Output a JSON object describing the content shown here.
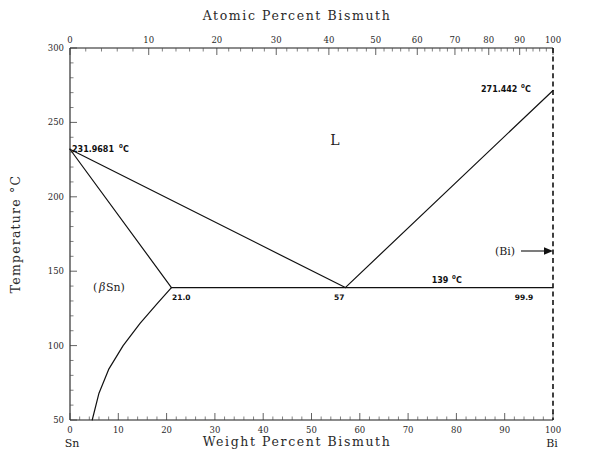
{
  "figure": {
    "title_top": "Atomic Percent Bismuth",
    "title_bottom": "Weight Percent Bismuth",
    "title_left": "Temperature °C",
    "left_endpoint": "Sn",
    "right_endpoint": "Bi"
  },
  "chart_data": {
    "type": "line",
    "xlabel": "Weight Percent Bismuth",
    "ylabel": "Temperature °C",
    "xlabel_secondary": "Atomic Percent Bismuth",
    "xlim": [
      0,
      100
    ],
    "ylim": [
      50,
      300
    ],
    "grid": false,
    "legend": "none",
    "x_ticks_bottom": [
      0,
      10,
      20,
      30,
      40,
      50,
      60,
      70,
      80,
      90,
      100
    ],
    "x_tick_labels_bottom": [
      "0",
      "10",
      "20",
      "30",
      "40",
      "50",
      "60",
      "70",
      "80",
      "90",
      "100"
    ],
    "y_ticks": [
      50,
      100,
      150,
      200,
      250,
      300
    ],
    "y_tick_labels": [
      "50",
      "100",
      "150",
      "200",
      "250",
      "300"
    ],
    "x_ticks_top_atomic": [
      0,
      10,
      20,
      30,
      40,
      50,
      60,
      70,
      80,
      90,
      100
    ],
    "x_tick_labels_top": [
      "0",
      "10",
      "20",
      "30",
      "40",
      "50",
      "60",
      "70",
      "80",
      "90",
      "100"
    ],
    "x_ticks_top_weight_positions": [
      0.0,
      16.3,
      30.4,
      42.7,
      53.6,
      63.3,
      71.9,
      79.7,
      86.7,
      93.1,
      100.0
    ],
    "series": [
      {
        "name": "Sn-rich liquidus",
        "comment": "liquidus from Sn melting point down to eutectic",
        "x": [
          0,
          57
        ],
        "y": [
          231.9681,
          139
        ]
      },
      {
        "name": "Bi-rich liquidus",
        "comment": "liquidus from eutectic up to Bi melting point",
        "x": [
          57,
          100
        ],
        "y": [
          139,
          271.442
        ]
      },
      {
        "name": "beta-Sn solidus",
        "comment": "solidus from Sn melting point to eutectic solubility limit",
        "x": [
          0,
          21.0
        ],
        "y": [
          231.9681,
          139
        ]
      },
      {
        "name": "eutectic horizontal",
        "comment": "invariant eutectic tie line at 139 C",
        "x": [
          21.0,
          99.9
        ],
        "y": [
          139,
          139
        ]
      },
      {
        "name": "beta-Sn solvus",
        "comment": "solid solubility boundary of Bi in beta-Sn",
        "x": [
          21.0,
          18.0,
          14.5,
          11.0,
          8.0,
          6.0,
          4.6
        ],
        "y": [
          139,
          128,
          115,
          100,
          84,
          68,
          50
        ]
      },
      {
        "name": "Bi terminal boundary",
        "comment": "near-pure Bi terminal solid solution edge, dashed",
        "x": [
          100,
          100
        ],
        "y": [
          50,
          300
        ]
      }
    ],
    "annotations": [
      {
        "name": "sn-melting-point",
        "text": "231.9681",
        "sup": "0",
        "unit": "C",
        "x": 0,
        "y": 231.9681
      },
      {
        "name": "bi-melting-point",
        "text": "271.442",
        "sup": "0",
        "unit": "C",
        "x": 100,
        "y": 271.442
      },
      {
        "name": "eutectic-temperature",
        "text": "139",
        "sup": "0",
        "unit": "C",
        "x": 65,
        "y": 139
      },
      {
        "name": "solvus-limit-composition",
        "text": "21.0",
        "x": 21.0,
        "y": 139
      },
      {
        "name": "eutectic-composition",
        "text": "57",
        "x": 57,
        "y": 139
      },
      {
        "name": "bi-terminal-composition",
        "text": "99.9",
        "x": 99.9,
        "y": 139
      },
      {
        "name": "liquid-phase-field",
        "text": "L",
        "x": 42,
        "y": 213
      },
      {
        "name": "beta-sn-phase-field",
        "text_pre": "(",
        "text_italic": "β",
        "text_post": "Sn)",
        "x": 8,
        "y": 142
      },
      {
        "name": "bi-phase-field",
        "text": "(Bi)",
        "x": 92,
        "y": 163
      }
    ]
  }
}
